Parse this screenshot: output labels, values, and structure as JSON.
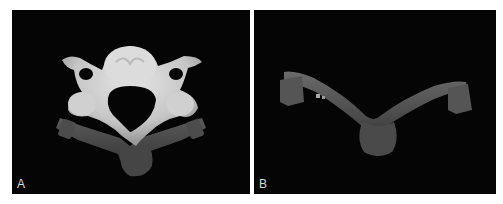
{
  "figure": {
    "panels": [
      {
        "label": "A",
        "content": "3D rendering of cervical vertebra (superior view) with guide template beneath",
        "background": "#050505"
      },
      {
        "label": "B",
        "content": "3D rendering of guide template alone (V-shaped, with cylindrical drill sleeves)",
        "background": "#050505"
      }
    ]
  }
}
